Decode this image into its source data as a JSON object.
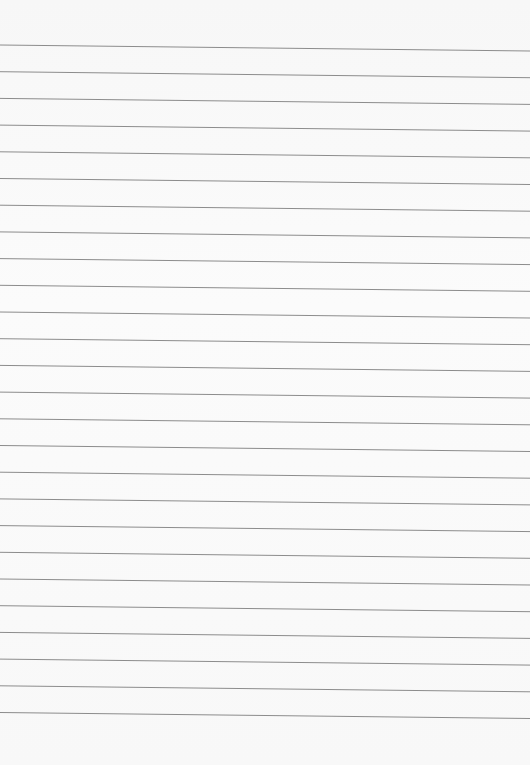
{
  "page": {
    "type": "lined-paper",
    "background": "#f9f9f9",
    "line_color": "#8c8c8c",
    "line_count": 26,
    "first_line_left_y": 45,
    "first_line_right_y": 51,
    "line_spacing": 26.7
  }
}
